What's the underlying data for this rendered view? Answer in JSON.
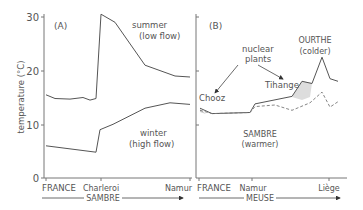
{
  "chart_data": [
    {
      "type": "line",
      "panel_label": "(A)",
      "ylabel": "temperature (°C)",
      "ylim": [
        0,
        30
      ],
      "yticks": [
        0,
        10,
        20,
        30
      ],
      "x_tick_labels": [
        "FRANCE",
        "Charleroi",
        "Namur"
      ],
      "river_label": "SAMBRE",
      "grid": false,
      "x_positions_px": [
        44,
        101,
        190
      ],
      "series": [
        {
          "name": "summer (low flow)",
          "label_line1": "summer",
          "label_line2": "(low flow)",
          "style": "solid",
          "points": [
            [
              46,
              15.5
            ],
            [
              55,
              14.8
            ],
            [
              70,
              14.7
            ],
            [
              83,
              15.0
            ],
            [
              90,
              14.5
            ],
            [
              96,
              14.8
            ],
            [
              101,
              30.5
            ],
            [
              115,
              29.0
            ],
            [
              145,
              21.0
            ],
            [
              175,
              19.0
            ],
            [
              190,
              18.8
            ]
          ]
        },
        {
          "name": "winter (high flow)",
          "label_line1": "winter",
          "label_line2": "(high flow)",
          "style": "solid",
          "points": [
            [
              46,
              6.0
            ],
            [
              75,
              5.3
            ],
            [
              96,
              4.8
            ],
            [
              100,
              9.0
            ],
            [
              113,
              10.0
            ],
            [
              145,
              13.0
            ],
            [
              170,
              14.0
            ],
            [
              190,
              13.7
            ]
          ]
        }
      ]
    },
    {
      "type": "line",
      "panel_label": "(B)",
      "ylim": [
        0,
        30
      ],
      "x_tick_labels": [
        "FRANCE",
        "Namur",
        "Liège"
      ],
      "river_label": "MEUSE",
      "grid": false,
      "annotations": [
        "nuclear plants",
        "Chooz",
        "Tihange",
        "OURTHE (colder)",
        "SAMBRE (warmer)"
      ],
      "series": [
        {
          "name": "observed",
          "style": "solid",
          "points": [
            [
              200,
              13.0
            ],
            [
              212,
              12.0
            ],
            [
              250,
              12.2
            ],
            [
              255,
              13.8
            ],
            [
              292,
              15.2
            ],
            [
              302,
              18.0
            ],
            [
              312,
              17.6
            ],
            [
              322,
              22.5
            ],
            [
              330,
              18.5
            ],
            [
              338,
              18.0
            ]
          ]
        },
        {
          "name": "without thermal discharge",
          "style": "dashed",
          "points": [
            [
              200,
              12.6
            ],
            [
              212,
              12.0
            ],
            [
              250,
              12.2
            ],
            [
              255,
              13.3
            ],
            [
              275,
              13.6
            ],
            [
              292,
              12.6
            ],
            [
              310,
              14.0
            ],
            [
              322,
              16.0
            ],
            [
              330,
              13.2
            ],
            [
              338,
              14.2
            ]
          ]
        }
      ]
    }
  ],
  "panel_a": {
    "label": "(A)",
    "ylabel": "temperature (°C)",
    "ytick_0": "0",
    "ytick_10": "10",
    "ytick_20": "20",
    "ytick_30": "30",
    "summer_1": "summer",
    "summer_2": "(low flow)",
    "winter_1": "winter",
    "winter_2": "(high flow)",
    "x1": "FRANCE",
    "x2": "Charleroi",
    "x3": "Namur",
    "river": "SAMBRE"
  },
  "panel_b": {
    "label": "(B)",
    "nuclear_1": "nuclear",
    "nuclear_2": "plants",
    "chooz": "Chooz",
    "tihange": "Tihange",
    "ourthe_1": "OURTHE",
    "ourthe_2": "(colder)",
    "sambre_1": "SAMBRE",
    "sambre_2": "(warmer)",
    "x1": "FRANCE",
    "x2": "Namur",
    "x3": "Liège",
    "river": "MEUSE"
  }
}
